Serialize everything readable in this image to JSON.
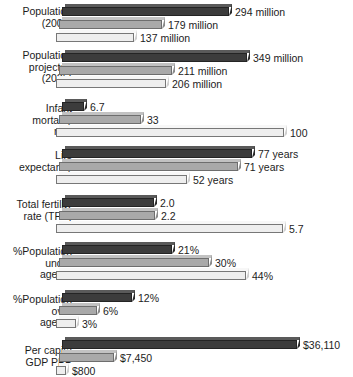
{
  "chart_data": {
    "type": "bar",
    "orientation": "horizontal",
    "title": "",
    "xlabel": "",
    "ylabel": "",
    "grid": false,
    "legend": "none",
    "note": "Grouped horizontal 3D bar chart; each category group is scaled independently. Three unlabeled series per group (dark, medium gray, light).",
    "series": [
      {
        "name": "series-1",
        "color": "#3c3c3c"
      },
      {
        "name": "series-2",
        "color": "#a9a9a9"
      },
      {
        "name": "series-3",
        "color": "#eeeeee"
      }
    ],
    "categories": [
      "Population\n(2004)",
      "Population\nprojected\n(2025)",
      "Infant\nmortality\nrate",
      "Life\nexpectancy",
      "Total fertility\nrate (TFR)",
      "%Population\nunder\nage 15",
      "%Population\nover\nage 65",
      "Per capita\nGDP PPP"
    ],
    "groups": [
      {
        "label": "Population\n(2004)",
        "bars": [
          {
            "value": 294,
            "label": "294 million"
          },
          {
            "value": 179,
            "label": "179 million"
          },
          {
            "value": 137,
            "label": "137 million"
          }
        ]
      },
      {
        "label": "Population\nprojected\n(2025)",
        "bars": [
          {
            "value": 349,
            "label": "349 million"
          },
          {
            "value": 211,
            "label": "211 million"
          },
          {
            "value": 206,
            "label": "206 million"
          }
        ]
      },
      {
        "label": "Infant\nmortality\nrate",
        "bars": [
          {
            "value": 6.7,
            "label": "6.7"
          },
          {
            "value": 33,
            "label": "33"
          },
          {
            "value": 100,
            "label": "100"
          }
        ]
      },
      {
        "label": "Life\nexpectancy",
        "bars": [
          {
            "value": 77,
            "label": "77 years"
          },
          {
            "value": 71,
            "label": "71 years"
          },
          {
            "value": 52,
            "label": "52 years"
          }
        ]
      },
      {
        "label": "Total fertility\nrate (TFR)",
        "bars": [
          {
            "value": 2.0,
            "label": "2.0"
          },
          {
            "value": 2.2,
            "label": "2.2"
          },
          {
            "value": 5.7,
            "label": "5.7"
          }
        ]
      },
      {
        "label": "%Population\nunder\nage 15",
        "bars": [
          {
            "value": 21,
            "label": "21%"
          },
          {
            "value": 30,
            "label": "30%"
          },
          {
            "value": 44,
            "label": "44%"
          }
        ]
      },
      {
        "label": "%Population\nover\nage 65",
        "bars": [
          {
            "value": 12,
            "label": "12%"
          },
          {
            "value": 6,
            "label": "6%"
          },
          {
            "value": 3,
            "label": "3%"
          }
        ]
      },
      {
        "label": "Per capita\nGDP PPP",
        "bars": [
          {
            "value": 36110,
            "label": "$36,110"
          },
          {
            "value": 7450,
            "label": "$7,450"
          },
          {
            "value": 800,
            "label": "$800"
          }
        ]
      }
    ]
  },
  "layout": {
    "group_tops": [
      4,
      50,
      99,
      146,
      195,
      242,
      290,
      337
    ],
    "label_tops": [
      6,
      50,
      103,
      150,
      199,
      246,
      294,
      345
    ],
    "bar_widths": [
      [
        167,
        103,
        78
      ],
      [
        185,
        113,
        110
      ],
      [
        22,
        82,
        228
      ],
      [
        190,
        179,
        131
      ],
      [
        92,
        96,
        227
      ],
      [
        110,
        150,
        190
      ],
      [
        70,
        38,
        20
      ],
      [
        235,
        55,
        10
      ]
    ]
  }
}
